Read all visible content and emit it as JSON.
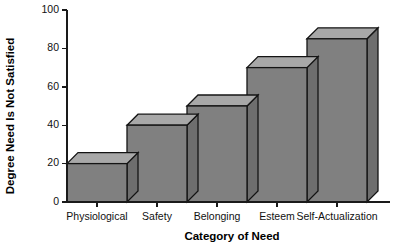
{
  "chart_data": {
    "type": "bar",
    "title": "",
    "subtitle": "",
    "categories": [
      "Physiological",
      "Safety",
      "Belonging",
      "Esteem",
      "Self-Actualization"
    ],
    "values": [
      20,
      40,
      50,
      70,
      85
    ],
    "xlabel": "Category of Need",
    "ylabel": "Degree Need Is Not Satisfied",
    "ylim": [
      0,
      100
    ],
    "yticks": [
      0,
      20,
      40,
      60,
      80,
      100
    ],
    "ytick_labels": [
      "0",
      "20",
      "40",
      "60",
      "80",
      "100"
    ],
    "grid": false,
    "legend": false,
    "legend_position": "none",
    "style": "3d-bar",
    "colors": {
      "bar_front": "#808080",
      "bar_top": "#a8a8a8",
      "bar_side": "#6e6e6e",
      "bar_outline": "#141414",
      "axis": "#1a1a1a",
      "text": "#111111",
      "background": "#ffffff"
    }
  }
}
